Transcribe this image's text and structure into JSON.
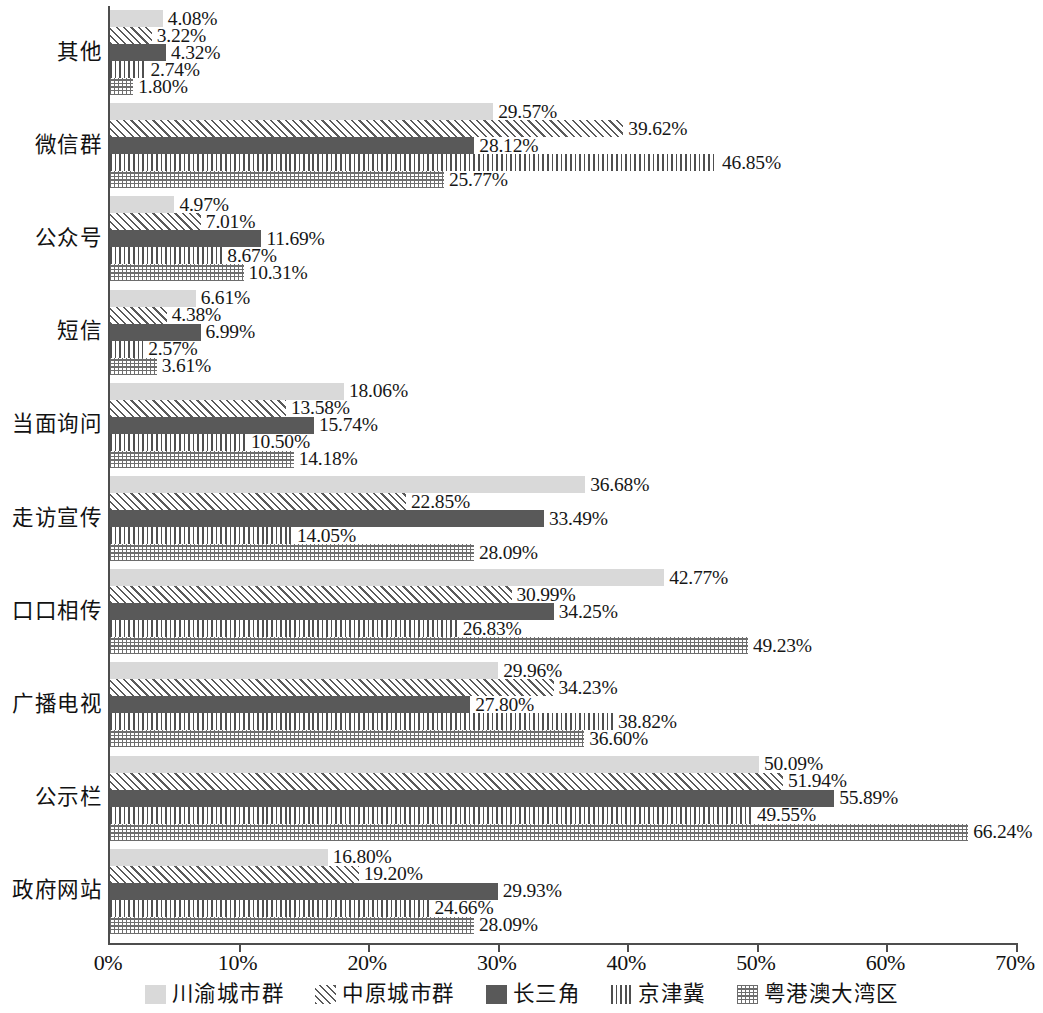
{
  "chart_data": {
    "type": "bar",
    "orientation": "horizontal",
    "title": "",
    "subtitle": "",
    "xlabel": "",
    "ylabel": "",
    "xlim": [
      0,
      70
    ],
    "xtick_labels": [
      "0%",
      "10%",
      "20%",
      "30%",
      "40%",
      "50%",
      "60%",
      "70%"
    ],
    "xtick_values": [
      0,
      10,
      20,
      30,
      40,
      50,
      60,
      70
    ],
    "grid": false,
    "legend_position": "bottom",
    "value_suffix": "%",
    "value_precision": 2,
    "categories": [
      "其他",
      "微信群",
      "公众号",
      "短信",
      "当面询问",
      "走访宣传",
      "口口相传",
      "广播电视",
      "公示栏",
      "政府网站"
    ],
    "series": [
      {
        "name": "川渝城市群",
        "pattern": "solid-light",
        "color": "#d9d9d9",
        "values": [
          4.08,
          29.57,
          4.97,
          6.61,
          18.06,
          36.68,
          42.77,
          29.96,
          50.09,
          16.8
        ],
        "labels": [
          "4.08%",
          "29.57%",
          "4.97%",
          "6.61%",
          "18.06%",
          "36.68%",
          "42.77%",
          "29.96%",
          "50.09%",
          "16.80%"
        ]
      },
      {
        "name": "中原城市群",
        "pattern": "diagonal-hatch",
        "color": "#5a5a5a",
        "values": [
          3.22,
          39.62,
          7.01,
          4.38,
          13.58,
          22.85,
          30.99,
          34.23,
          51.94,
          19.2
        ],
        "labels": [
          "3.22%",
          "39.62%",
          "7.01%",
          "4.38%",
          "13.58%",
          "22.85%",
          "30.99%",
          "34.23%",
          "51.94%",
          "19.20%"
        ]
      },
      {
        "name": "长三角",
        "pattern": "solid-dark",
        "color": "#595959",
        "values": [
          4.32,
          28.12,
          11.69,
          6.99,
          15.74,
          33.49,
          34.25,
          27.8,
          55.89,
          29.93
        ],
        "labels": [
          "4.32%",
          "28.12%",
          "11.69%",
          "6.99%",
          "15.74%",
          "33.49%",
          "34.25%",
          "27.80%",
          "55.89%",
          "29.93%"
        ]
      },
      {
        "name": "京津冀",
        "pattern": "vertical-lines",
        "color": "#4f4f4f",
        "values": [
          2.74,
          46.85,
          8.67,
          2.57,
          10.5,
          14.05,
          26.83,
          38.82,
          49.55,
          24.66
        ],
        "labels": [
          "2.74%",
          "46.85%",
          "8.67%",
          "2.57%",
          "10.50%",
          "14.05%",
          "26.83%",
          "38.82%",
          "49.55%",
          "24.66%"
        ]
      },
      {
        "name": "粤港澳大湾区",
        "pattern": "dotted-grid",
        "color": "#6d6d6d",
        "values": [
          1.8,
          25.77,
          10.31,
          3.61,
          14.18,
          28.09,
          49.23,
          36.6,
          66.24,
          28.09
        ],
        "labels": [
          "1.80%",
          "25.77%",
          "10.31%",
          "3.61%",
          "14.18%",
          "28.09%",
          "49.23%",
          "36.60%",
          "66.24%",
          "28.09%"
        ]
      }
    ]
  },
  "legend": {
    "items": [
      {
        "label": "川渝城市群",
        "pattern": "solid-light"
      },
      {
        "label": "中原城市群",
        "pattern": "diagonal-hatch"
      },
      {
        "label": "长三角",
        "pattern": "solid-dark"
      },
      {
        "label": "京津冀",
        "pattern": "vertical-lines"
      },
      {
        "label": "粤港澳大湾区",
        "pattern": "dotted-grid"
      }
    ]
  },
  "axis": {
    "x_axis_color": "#4d4d4d",
    "y_axis_color": "#4d4d4d"
  }
}
